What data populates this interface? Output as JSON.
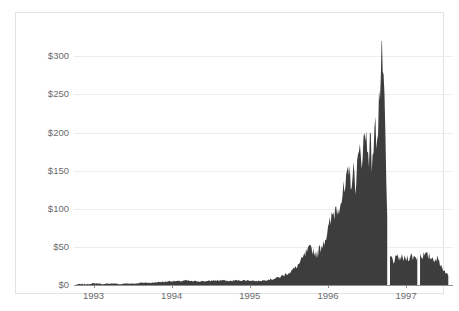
{
  "chart_data": {
    "type": "area",
    "title": "",
    "subtitle": "",
    "xlabel": "",
    "ylabel": "",
    "ylim": [
      0,
      320
    ],
    "xlim": [
      1992.75,
      1997.6
    ],
    "grid": true,
    "legend": null,
    "y_ticks": [
      0,
      50,
      100,
      150,
      200,
      250,
      300
    ],
    "y_tick_labels": [
      "$0",
      "$50",
      "$100",
      "$150",
      "$200",
      "$250",
      "$300"
    ],
    "x_ticks": [
      1993,
      1994,
      1995,
      1996,
      1997
    ],
    "x_tick_labels": [
      "1993",
      "1994",
      "1995",
      "1996",
      "1997"
    ],
    "series": [
      {
        "name": "price",
        "fill_color": "#3d3d3d",
        "x": [
          1992.78,
          1992.85,
          1992.92,
          1992.99,
          1993.06,
          1993.13,
          1993.2,
          1993.27,
          1993.34,
          1993.41,
          1993.48,
          1993.55,
          1993.62,
          1993.69,
          1993.76,
          1993.83,
          1993.9,
          1993.97,
          1994.04,
          1994.11,
          1994.18,
          1994.25,
          1994.32,
          1994.39,
          1994.46,
          1994.53,
          1994.6,
          1994.67,
          1994.74,
          1994.81,
          1994.88,
          1994.95,
          1995.02,
          1995.09,
          1995.16,
          1995.23,
          1995.3,
          1995.37,
          1995.44,
          1995.51,
          1995.58,
          1995.65,
          1995.72,
          1995.79,
          1995.86,
          1995.93,
          1996.0,
          1996.07,
          1996.14,
          1996.21,
          1996.28,
          1996.35,
          1996.42,
          1996.49,
          1996.56,
          1996.63,
          1996.7,
          1996.77,
          1996.84,
          1996.91,
          1996.98,
          1997.05,
          1997.12,
          1997.19,
          1997.26,
          1997.33,
          1997.4,
          1997.47,
          1997.54
        ],
        "values": [
          1,
          1,
          1,
          2,
          2,
          1,
          2,
          2,
          1,
          2,
          2,
          2,
          3,
          3,
          3,
          4,
          4,
          5,
          5,
          5,
          6,
          5,
          5,
          5,
          5,
          6,
          6,
          6,
          5,
          6,
          6,
          6,
          6,
          5,
          6,
          7,
          8,
          10,
          13,
          17,
          22,
          30,
          42,
          48,
          40,
          55,
          70,
          95,
          110,
          120,
          145,
          140,
          175,
          195,
          170,
          210,
          305,
          40,
          32,
          36,
          34,
          38,
          36,
          40,
          38,
          36,
          34,
          22,
          12
        ],
        "peak_value": 305,
        "peak_x": 1996.7,
        "post_crash_plateau": 36,
        "final_value": 12,
        "gaps_at_x": [
          1996.78,
          1997.16
        ]
      }
    ]
  },
  "axis": {
    "y_axis_name": "price-axis",
    "x_axis_name": "year-axis"
  },
  "colors": {
    "series_fill": "#3d3d3d",
    "gridline": "#ededed",
    "axis_line": "#8f8f8f",
    "tick_text": "#6b6b6b",
    "frame_border": "#e3e3e3",
    "background": "#ffffff"
  }
}
